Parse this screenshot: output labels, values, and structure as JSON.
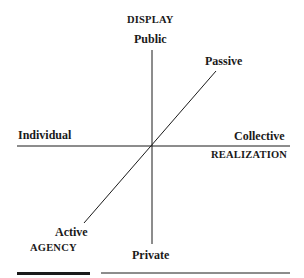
{
  "diagram": {
    "type": "three-axis conceptual diagram",
    "axes": [
      {
        "name": "DISPLAY",
        "orientation": "vertical",
        "positive_pole": "Public",
        "negative_pole": "Private"
      },
      {
        "name": "REALIZATION",
        "orientation": "horizontal",
        "positive_pole": "Collective",
        "negative_pole": "Individual"
      },
      {
        "name": "AGENCY",
        "orientation": "diagonal",
        "positive_pole": "Passive",
        "negative_pole": "Active"
      }
    ],
    "labels": {
      "display_axis": "DISPLAY",
      "public": "Public",
      "private": "Private",
      "individual": "Individual",
      "collective": "Collective",
      "realization_axis": "REALIZATION",
      "passive": "Passive",
      "active": "Active",
      "agency_axis": "AGENCY"
    },
    "colors": {
      "line": "#1a1a1a",
      "text": "#1a1a1a",
      "background": "#ffffff"
    }
  }
}
